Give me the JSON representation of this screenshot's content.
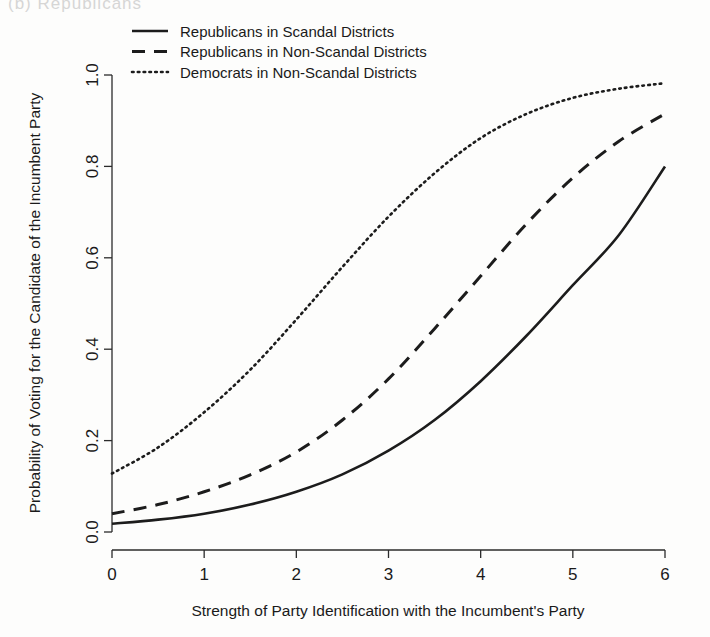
{
  "figure": {
    "top_partial_caption": "(b)   Republicans",
    "background_color": "#fdfdfc",
    "line_color": "#1c1c1c"
  },
  "chart_data": {
    "type": "line",
    "title": "",
    "xlabel": "Strength of Party Identification with the Incumbent's Party",
    "ylabel": "Probability of Voting for the Candidate of the Incumbent Party",
    "xlim": [
      0,
      6
    ],
    "ylim": [
      0,
      1
    ],
    "xticks": [
      0,
      1,
      2,
      3,
      4,
      5,
      6
    ],
    "xticklabels": [
      "0",
      "1",
      "2",
      "3",
      "4",
      "5",
      "6"
    ],
    "yticks": [
      0.0,
      0.2,
      0.4,
      0.6,
      0.8,
      1.0
    ],
    "yticklabels": [
      "0.0",
      "0.2",
      "0.4",
      "0.6",
      "0.8",
      "1.0"
    ],
    "grid": false,
    "legend_position": "top-left",
    "x": [
      0,
      0.5,
      1,
      1.5,
      2,
      2.5,
      3,
      3.5,
      4,
      4.5,
      5,
      5.5,
      6
    ],
    "series": [
      {
        "name": "Republicans in Scandal Districts",
        "style": "solid",
        "values": [
          0.018,
          0.027,
          0.04,
          0.06,
          0.088,
          0.126,
          0.178,
          0.245,
          0.33,
          0.43,
          0.54,
          0.65,
          0.8
        ]
      },
      {
        "name": "Republicans in Non-Scandal Districts",
        "style": "dashed",
        "values": [
          0.04,
          0.06,
          0.088,
          0.125,
          0.175,
          0.245,
          0.335,
          0.445,
          0.56,
          0.675,
          0.775,
          0.855,
          0.915
        ]
      },
      {
        "name": "Democrats in Non-Scandal Districts",
        "style": "dotted",
        "values": [
          0.128,
          0.185,
          0.262,
          0.355,
          0.465,
          0.58,
          0.69,
          0.785,
          0.862,
          0.915,
          0.95,
          0.97,
          0.982
        ]
      }
    ]
  },
  "legend": {
    "entries": [
      {
        "label": "Republicans in Scandal Districts",
        "style": "solid"
      },
      {
        "label": "Republicans in Non-Scandal Districts",
        "style": "dashed"
      },
      {
        "label": "Democrats in Non-Scandal Districts",
        "style": "dotted"
      }
    ]
  }
}
